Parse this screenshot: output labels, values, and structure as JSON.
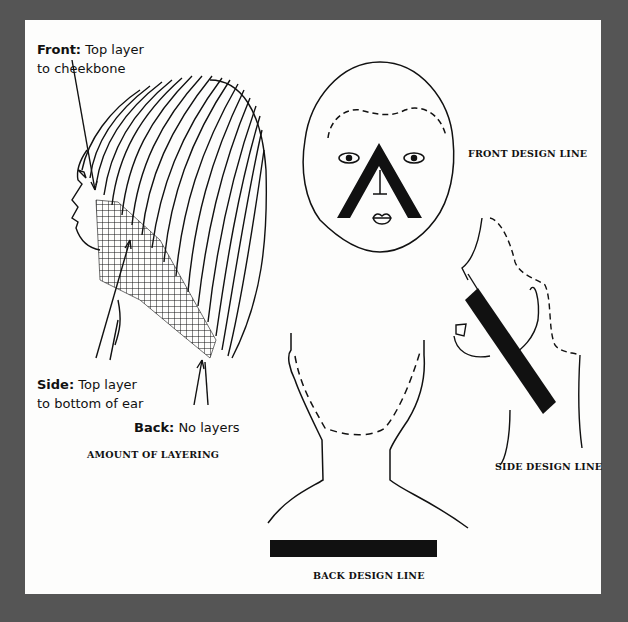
{
  "diagram": {
    "panels": {
      "layering": {
        "caption": "AMOUNT OF LAYERING",
        "callouts": {
          "front": {
            "term": "Front:",
            "text_line1": "Top layer",
            "text_line2": "to cheekbone"
          },
          "side": {
            "term": "Side:",
            "text_line1": "Top layer",
            "text_line2": "to bottom of ear"
          },
          "back": {
            "term": "Back:",
            "text_line1": "No layers"
          }
        }
      },
      "front": {
        "caption": "FRONT DESIGN LINE"
      },
      "side": {
        "caption": "SIDE DESIGN LINE"
      },
      "back": {
        "caption": "BACK DESIGN LINE"
      }
    },
    "colors": {
      "border": "#555555",
      "paper": "#fdfdfc",
      "ink": "#111111"
    }
  }
}
